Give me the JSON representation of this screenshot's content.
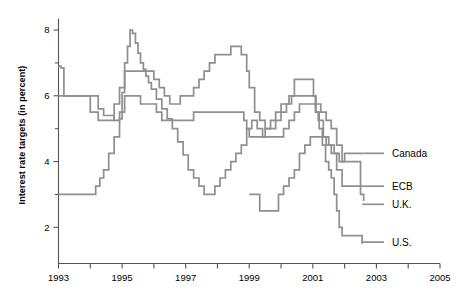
{
  "chart_data": {
    "type": "line",
    "title": "",
    "xlabel": "",
    "ylabel": "Interest rate targets (in percent)",
    "xlim": [
      1993,
      2005
    ],
    "ylim": [
      0.9,
      8.35
    ],
    "yticks": [
      2,
      4,
      6,
      8
    ],
    "yticklabels": [
      "2",
      "4",
      "6",
      "8"
    ],
    "yminorticks": [
      3,
      5,
      7
    ],
    "xticks": [
      1993,
      1994,
      1995,
      1996,
      1997,
      1998,
      1999,
      2000,
      2001,
      2002,
      2003,
      2004,
      2005
    ],
    "xticklabels": [
      "1993",
      "",
      "1995",
      "",
      "1997",
      "",
      "1999",
      "",
      "2001",
      "",
      "2003",
      "",
      "2005"
    ],
    "xtick_labeled": [
      1993,
      1995,
      1997,
      1999,
      2001,
      2003,
      2005
    ],
    "grid": false,
    "legend_position": "right-inline",
    "line_color": "#8f8f8f",
    "axis_color": "#555555",
    "step_style": "post",
    "series": [
      {
        "name": "Canada",
        "label": "Canada",
        "label_value": 4.25,
        "points": [
          [
            1993.0,
            6.9
          ],
          [
            1993.08,
            6.85
          ],
          [
            1993.17,
            6.0
          ],
          [
            1994.0,
            6.0
          ],
          [
            1994.25,
            5.6
          ],
          [
            1994.42,
            5.4
          ],
          [
            1994.58,
            5.4
          ],
          [
            1994.75,
            5.25
          ],
          [
            1994.92,
            5.3
          ],
          [
            1995.0,
            6.1
          ],
          [
            1995.08,
            7.0
          ],
          [
            1995.17,
            7.5
          ],
          [
            1995.25,
            8.0
          ],
          [
            1995.33,
            7.9
          ],
          [
            1995.42,
            7.6
          ],
          [
            1995.5,
            7.3
          ],
          [
            1995.58,
            7.0
          ],
          [
            1995.67,
            6.8
          ],
          [
            1995.75,
            6.6
          ],
          [
            1995.83,
            6.4
          ],
          [
            1995.92,
            6.2
          ],
          [
            1996.08,
            5.9
          ],
          [
            1996.25,
            5.6
          ],
          [
            1996.42,
            5.3
          ],
          [
            1996.58,
            5.0
          ],
          [
            1996.75,
            4.6
          ],
          [
            1996.92,
            4.2
          ],
          [
            1997.08,
            3.75
          ],
          [
            1997.25,
            3.5
          ],
          [
            1997.42,
            3.25
          ],
          [
            1997.58,
            3.0
          ],
          [
            1997.75,
            3.0
          ],
          [
            1997.92,
            3.25
          ],
          [
            1998.08,
            3.5
          ],
          [
            1998.25,
            3.75
          ],
          [
            1998.42,
            4.0
          ],
          [
            1998.58,
            4.25
          ],
          [
            1998.75,
            4.5
          ],
          [
            1998.92,
            5.0
          ],
          [
            1999.08,
            5.25
          ],
          [
            1999.25,
            5.0
          ],
          [
            1999.42,
            4.75
          ],
          [
            1999.58,
            4.75
          ],
          [
            1999.75,
            4.75
          ],
          [
            1999.92,
            4.75
          ],
          [
            2000.08,
            5.0
          ],
          [
            2000.25,
            5.25
          ],
          [
            2000.42,
            5.5
          ],
          [
            2000.58,
            5.75
          ],
          [
            2000.75,
            5.75
          ],
          [
            2000.92,
            5.75
          ],
          [
            2001.08,
            5.5
          ],
          [
            2001.17,
            5.25
          ],
          [
            2001.33,
            4.75
          ],
          [
            2001.5,
            4.5
          ],
          [
            2001.67,
            4.25
          ],
          [
            2001.83,
            4.0
          ],
          [
            2002.0,
            4.25
          ],
          [
            2002.25,
            4.25
          ],
          [
            2002.6,
            4.25
          ]
        ]
      },
      {
        "name": "ECB",
        "label": "ECB",
        "label_value": 3.25,
        "points": [
          [
            1999.0,
            3.0
          ],
          [
            1999.25,
            3.0
          ],
          [
            1999.33,
            2.5
          ],
          [
            1999.75,
            2.5
          ],
          [
            1999.92,
            3.0
          ],
          [
            2000.08,
            3.25
          ],
          [
            2000.25,
            3.5
          ],
          [
            2000.42,
            3.75
          ],
          [
            2000.58,
            4.25
          ],
          [
            2000.75,
            4.5
          ],
          [
            2000.92,
            4.75
          ],
          [
            2001.25,
            4.75
          ],
          [
            2001.42,
            4.5
          ],
          [
            2001.58,
            4.25
          ],
          [
            2001.75,
            3.75
          ],
          [
            2001.92,
            3.25
          ],
          [
            2002.25,
            3.25
          ],
          [
            2002.6,
            3.25
          ]
        ]
      },
      {
        "name": "U.K.",
        "label": "U.K.",
        "label_value": 2.8,
        "points": [
          [
            1993.0,
            6.0
          ],
          [
            1993.83,
            6.0
          ],
          [
            1994.0,
            5.5
          ],
          [
            1994.25,
            5.25
          ],
          [
            1994.42,
            5.25
          ],
          [
            1994.58,
            5.25
          ],
          [
            1994.75,
            5.75
          ],
          [
            1994.92,
            6.25
          ],
          [
            1995.0,
            6.25
          ],
          [
            1995.08,
            6.75
          ],
          [
            1995.25,
            6.75
          ],
          [
            1995.75,
            6.75
          ],
          [
            1996.0,
            6.5
          ],
          [
            1996.17,
            6.25
          ],
          [
            1996.33,
            6.0
          ],
          [
            1996.5,
            5.75
          ],
          [
            1996.67,
            5.75
          ],
          [
            1996.83,
            6.0
          ],
          [
            1997.0,
            6.0
          ],
          [
            1997.25,
            6.25
          ],
          [
            1997.42,
            6.5
          ],
          [
            1997.58,
            6.75
          ],
          [
            1997.75,
            7.0
          ],
          [
            1997.92,
            7.25
          ],
          [
            1998.08,
            7.25
          ],
          [
            1998.25,
            7.25
          ],
          [
            1998.42,
            7.5
          ],
          [
            1998.58,
            7.5
          ],
          [
            1998.75,
            7.25
          ],
          [
            1998.92,
            6.75
          ],
          [
            1999.0,
            6.25
          ],
          [
            1999.17,
            5.5
          ],
          [
            1999.33,
            5.25
          ],
          [
            1999.5,
            5.0
          ],
          [
            1999.67,
            5.0
          ],
          [
            1999.83,
            5.25
          ],
          [
            2000.0,
            5.5
          ],
          [
            2000.17,
            5.75
          ],
          [
            2000.33,
            6.0
          ],
          [
            2000.5,
            6.0
          ],
          [
            2000.92,
            6.0
          ],
          [
            2001.08,
            5.75
          ],
          [
            2001.25,
            5.5
          ],
          [
            2001.42,
            5.25
          ],
          [
            2001.58,
            5.0
          ],
          [
            2001.75,
            4.5
          ],
          [
            2001.92,
            4.0
          ],
          [
            2002.08,
            4.0
          ],
          [
            2002.33,
            4.0
          ],
          [
            2002.5,
            3.0
          ],
          [
            2002.6,
            2.8
          ]
        ]
      },
      {
        "name": "U.S.",
        "label": "U.S.",
        "label_value": 1.75,
        "points": [
          [
            1993.0,
            3.0
          ],
          [
            1994.0,
            3.0
          ],
          [
            1994.17,
            3.25
          ],
          [
            1994.3,
            3.5
          ],
          [
            1994.42,
            3.75
          ],
          [
            1994.58,
            4.25
          ],
          [
            1994.75,
            4.75
          ],
          [
            1994.92,
            5.5
          ],
          [
            1995.08,
            6.0
          ],
          [
            1995.33,
            6.0
          ],
          [
            1995.5,
            6.0
          ],
          [
            1995.58,
            5.75
          ],
          [
            1995.92,
            5.75
          ],
          [
            1996.08,
            5.5
          ],
          [
            1996.25,
            5.25
          ],
          [
            1996.5,
            5.25
          ],
          [
            1997.0,
            5.25
          ],
          [
            1997.25,
            5.5
          ],
          [
            1997.5,
            5.5
          ],
          [
            1998.0,
            5.5
          ],
          [
            1998.5,
            5.5
          ],
          [
            1998.75,
            5.5
          ],
          [
            1998.83,
            5.25
          ],
          [
            1998.92,
            5.0
          ],
          [
            1999.0,
            4.75
          ],
          [
            1999.25,
            4.75
          ],
          [
            1999.5,
            5.0
          ],
          [
            1999.67,
            5.25
          ],
          [
            1999.83,
            5.5
          ],
          [
            2000.0,
            5.75
          ],
          [
            2000.25,
            6.0
          ],
          [
            2000.42,
            6.5
          ],
          [
            2000.58,
            6.5
          ],
          [
            2000.92,
            6.5
          ],
          [
            2001.02,
            6.0
          ],
          [
            2001.1,
            5.5
          ],
          [
            2001.2,
            5.0
          ],
          [
            2001.3,
            4.5
          ],
          [
            2001.4,
            4.0
          ],
          [
            2001.5,
            3.75
          ],
          [
            2001.58,
            3.5
          ],
          [
            2001.67,
            3.0
          ],
          [
            2001.75,
            2.5
          ],
          [
            2001.83,
            2.0
          ],
          [
            2001.92,
            1.75
          ],
          [
            2002.33,
            1.75
          ],
          [
            2002.45,
            1.75
          ],
          [
            2002.55,
            1.5
          ]
        ]
      }
    ]
  },
  "axes": {
    "y_axis_title": "Interest rate targets (in percent)"
  }
}
